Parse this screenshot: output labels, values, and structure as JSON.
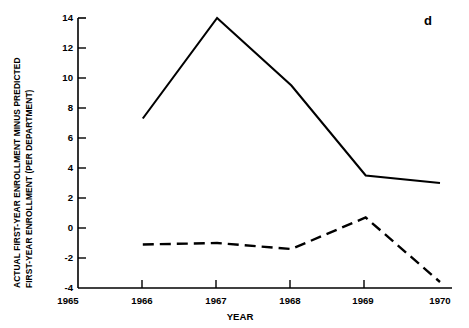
{
  "chart_data": {
    "type": "line",
    "title": "",
    "panel_label": "d",
    "xlabel": "YEAR",
    "ylabel": "ACTUAL FIRST-YEAR ENROLLMENT MINUS PREDICTED FIRST-YEAR ENROLLMENT (PER DEPARTMENT)",
    "ylabel_lines": [
      "ACTUAL FIRST-YEAR ENROLLMENT MINUS PREDICTED",
      "FIRST-YEAR ENROLLMENT (PER DEPARTMENT)"
    ],
    "x": [
      1966,
      1967,
      1968,
      1969,
      1970
    ],
    "xlim": [
      1965,
      1970
    ],
    "ylim": [
      -4,
      14
    ],
    "xticks": [
      1965,
      1966,
      1967,
      1968,
      1969,
      1970
    ],
    "xticklabels": [
      "1965",
      "1966",
      "1967",
      "1968",
      "1969",
      "1970"
    ],
    "yticks": [
      -4,
      -2,
      0,
      2,
      4,
      6,
      8,
      10,
      12,
      14
    ],
    "yticklabels": [
      "-4",
      "-2",
      "0",
      "2",
      "4",
      "6",
      "8",
      "10",
      "12",
      "14"
    ],
    "grid": false,
    "legend": "none",
    "series": [
      {
        "name": "solid-series",
        "style": "solid",
        "color": "#000000",
        "values": [
          7.3,
          14.0,
          9.5,
          3.5,
          3.0
        ]
      },
      {
        "name": "dashed-series",
        "style": "dashed",
        "color": "#000000",
        "values": [
          -1.1,
          -1.0,
          -1.4,
          0.7,
          -3.6
        ]
      }
    ]
  }
}
